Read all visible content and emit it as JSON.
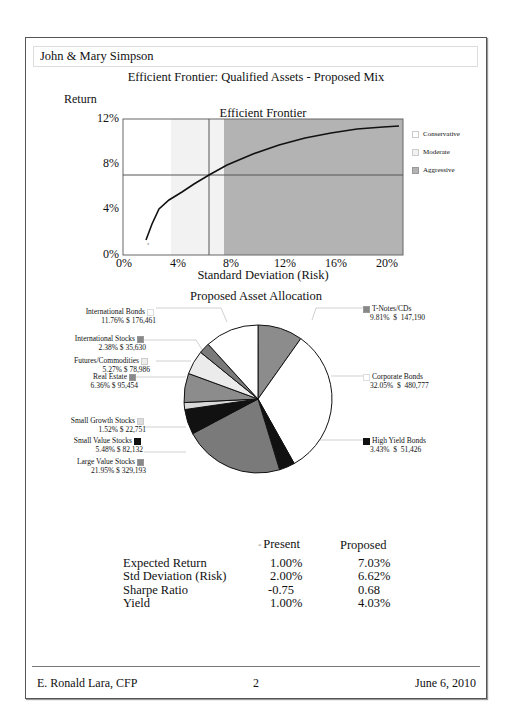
{
  "header": {
    "client": "John & Mary Simpson",
    "title": "Efficient Frontier: Qualified Assets - Proposed Mix"
  },
  "frontier": {
    "ylabel": "Return",
    "title": "Efficient Frontier",
    "xlabel": "Standard Deviation (Risk)",
    "yticks": [
      "0%",
      "4%",
      "8%",
      "12%"
    ],
    "xticks": [
      "0%",
      "4%",
      "8%",
      "12%",
      "16%",
      "20%"
    ],
    "legend": [
      {
        "label": "Conservative",
        "color": "#ffffff"
      },
      {
        "label": "Moderate",
        "color": "#f2f2f2"
      },
      {
        "label": "Aggressive",
        "color": "#b3b3b3"
      }
    ]
  },
  "pie": {
    "title": "Proposed Asset Allocation",
    "slices": [
      {
        "name": "T-Notes/CDs",
        "pct": "9.81%",
        "amount": "147,190",
        "color": "#8c8c8c"
      },
      {
        "name": "Corporate Bonds",
        "pct": "32.05%",
        "amount": "480,777",
        "color": "#ffffff"
      },
      {
        "name": "High Yield Bonds",
        "pct": "3.43%",
        "amount": "51,426",
        "color": "#111111"
      },
      {
        "name": "Large Value Stocks",
        "pct": "21.95%",
        "amount": "329,193",
        "color": "#7a7a7a"
      },
      {
        "name": "Small Value Stocks",
        "pct": "5.48%",
        "amount": "82,132",
        "color": "#111111"
      },
      {
        "name": "Small Growth Stocks",
        "pct": "1.52%",
        "amount": "22,751",
        "color": "#d9d9d9"
      },
      {
        "name": "Real Estate",
        "pct": "6.36%",
        "amount": "95,454",
        "color": "#8c8c8c"
      },
      {
        "name": "Futures/Commodities",
        "pct": "5.27%",
        "amount": "78,986",
        "color": "#ebebeb"
      },
      {
        "name": "International Stocks",
        "pct": "2.38%",
        "amount": "35,630",
        "color": "#7a7a7a"
      },
      {
        "name": "International Bonds",
        "pct": "11.76%",
        "amount": "176,461",
        "color": "#ffffff"
      }
    ]
  },
  "summary": {
    "col_present": "Present",
    "col_proposed": "Proposed",
    "rows": [
      {
        "label": "Expected Return",
        "present": "1.00%",
        "proposed": "7.03%"
      },
      {
        "label": "Std Deviation (Risk)",
        "present": "2.00%",
        "proposed": "6.62%"
      },
      {
        "label": "Sharpe Ratio",
        "present": "-0.75",
        "proposed": "0.68"
      },
      {
        "label": "Yield",
        "present": "1.00%",
        "proposed": "4.03%"
      }
    ]
  },
  "footer": {
    "advisor": "E. Ronald Lara, CFP",
    "page": "2",
    "date": "June 6, 2010"
  },
  "chart_data": [
    {
      "type": "line",
      "title": "Efficient Frontier",
      "xlabel": "Standard Deviation (Risk)",
      "ylabel": "Return",
      "xlim": [
        0,
        21.5
      ],
      "ylim": [
        0,
        12
      ],
      "x": [
        1.8,
        2.2,
        2.8,
        3.5,
        4.5,
        5.5,
        6.6,
        8,
        10,
        12,
        14,
        16,
        18,
        20,
        21
      ],
      "y": [
        1.3,
        2.8,
        4.2,
        4.9,
        5.6,
        6.3,
        7.03,
        7.9,
        8.9,
        9.7,
        10.3,
        10.8,
        11.1,
        11.25,
        11.3
      ],
      "points": [
        {
          "label": "Present",
          "x": 2.0,
          "y": 1.0
        },
        {
          "label": "Proposed",
          "x": 6.62,
          "y": 7.03
        }
      ],
      "bands": [
        {
          "label": "Conservative",
          "from": 0,
          "to": 3.7
        },
        {
          "label": "Moderate",
          "from": 3.7,
          "to": 7.8
        },
        {
          "label": "Aggressive",
          "from": 7.8,
          "to": 21.5
        }
      ]
    },
    {
      "type": "pie",
      "title": "Proposed Asset Allocation",
      "categories": [
        "T-Notes/CDs",
        "Corporate Bonds",
        "High Yield Bonds",
        "Large Value Stocks",
        "Small Value Stocks",
        "Small Growth Stocks",
        "Real Estate",
        "Futures/Commodities",
        "International Stocks",
        "International Bonds"
      ],
      "values": [
        9.81,
        32.05,
        3.43,
        21.95,
        5.48,
        1.52,
        6.36,
        5.27,
        2.38,
        11.76
      ],
      "amounts": [
        147190,
        480777,
        51426,
        329193,
        82132,
        22751,
        95454,
        78986,
        35630,
        176461
      ]
    }
  ]
}
